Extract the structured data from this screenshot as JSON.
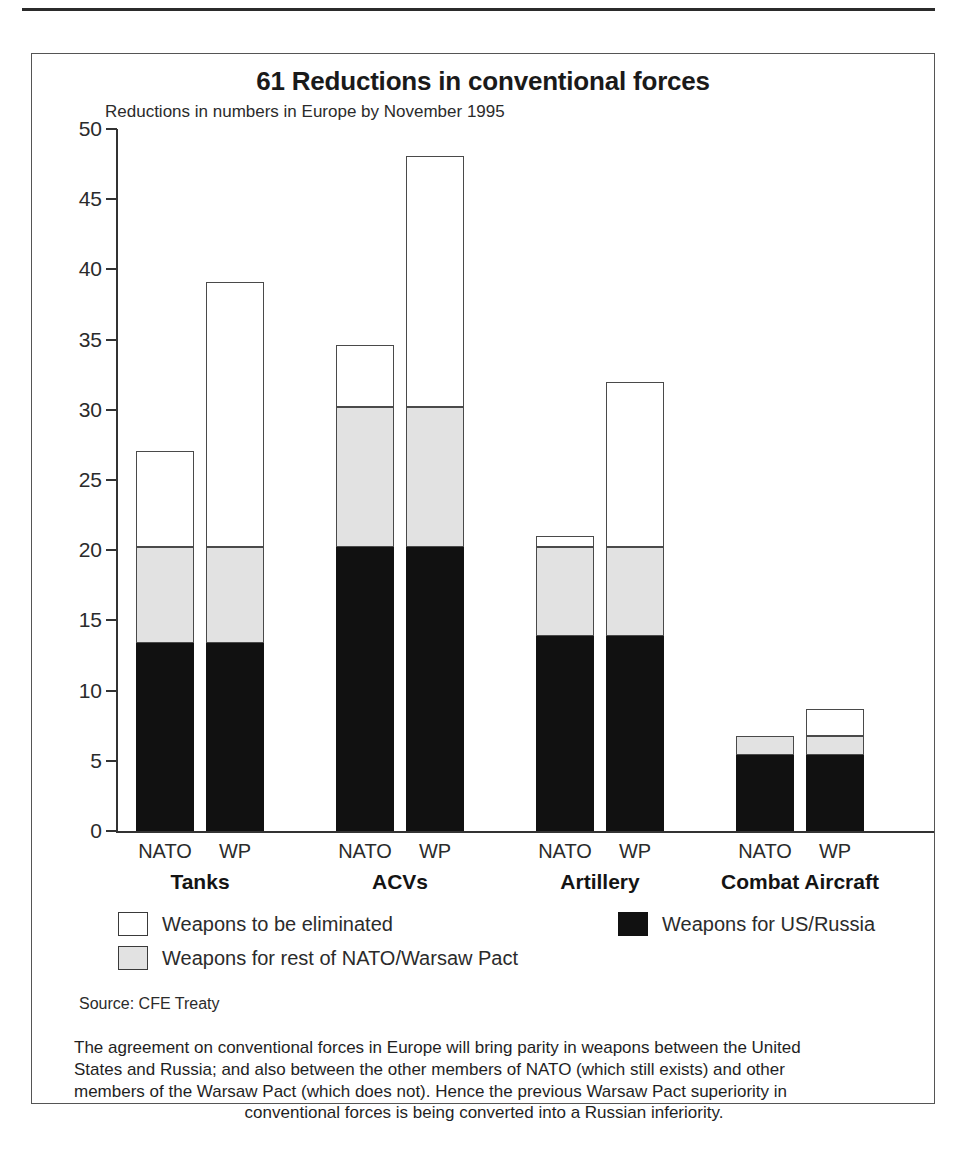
{
  "chart_data": {
    "type": "bar",
    "subtype": "stacked",
    "title": "61 Reductions in conventional forces",
    "subtitle": "Reductions in numbers in Europe by November 1995",
    "xlabel": "",
    "ylabel": "",
    "ylim": [
      0,
      50
    ],
    "ytick_labels": [
      "0",
      "5",
      "10",
      "15",
      "20",
      "25",
      "30",
      "35",
      "40",
      "45",
      "50"
    ],
    "ytick_values": [
      0,
      5,
      10,
      15,
      20,
      25,
      30,
      35,
      40,
      45,
      50
    ],
    "grid": false,
    "legend_position": "below-axes",
    "groups": [
      "Tanks",
      "ACVs",
      "Artillery",
      "Combat Aircraft"
    ],
    "categories": [
      "Tanks NATO",
      "Tanks WP",
      "ACVs NATO",
      "ACVs WP",
      "Artillery NATO",
      "Artillery WP",
      "Combat Aircraft NATO",
      "Combat Aircraft WP"
    ],
    "bar_labels": [
      "NATO",
      "WP",
      "NATO",
      "WP",
      "NATO",
      "WP",
      "NATO",
      "WP"
    ],
    "series": [
      {
        "name": "Weapons for US/Russia",
        "color": "#111111",
        "values": [
          13.4,
          13.4,
          20.2,
          20.2,
          13.9,
          13.9,
          5.4,
          5.4
        ]
      },
      {
        "name": "Weapons for rest of NATO/Warsaw Pact",
        "color": "#e2e2e2",
        "values": [
          6.8,
          6.8,
          10.0,
          10.0,
          6.3,
          6.3,
          1.4,
          1.4
        ]
      },
      {
        "name": "Weapons to be eliminated",
        "color": "#ffffff",
        "values": [
          6.9,
          18.9,
          4.4,
          17.9,
          0.8,
          11.8,
          0.0,
          1.9
        ]
      }
    ],
    "totals": [
      27.1,
      39.1,
      34.6,
      48.1,
      21.0,
      32.0,
      6.8,
      8.7
    ],
    "cumulative_tops": {
      "black": [
        13.4,
        13.4,
        20.2,
        20.2,
        13.9,
        13.9,
        5.4,
        5.4
      ],
      "grey": [
        20.2,
        20.2,
        30.2,
        30.2,
        20.2,
        20.2,
        6.8,
        6.8
      ],
      "white": [
        27.1,
        39.1,
        34.6,
        48.1,
        21.0,
        32.0,
        6.8,
        8.7
      ]
    }
  },
  "legend": {
    "items": [
      {
        "label": "Weapons to be eliminated",
        "swatch": "white"
      },
      {
        "label": "Weapons for US/Russia",
        "swatch": "black"
      },
      {
        "label": "Weapons for rest of NATO/Warsaw Pact",
        "swatch": "grey"
      }
    ]
  },
  "source": "Source: CFE Treaty",
  "caption": {
    "line1": "The agreement on conventional forces in Europe will bring parity in weapons between the United",
    "line2": "States and Russia; and also between the other members of NATO (which still exists) and other",
    "line3": "members of the Warsaw Pact (which does not). Hence the previous Warsaw Pact superiority in",
    "line4": "conventional forces is being converted into a Russian inferiority."
  },
  "colors": {
    "us_russia": "#111111",
    "rest": "#e2e2e2",
    "eliminated": "#ffffff",
    "frame": "#555555",
    "axis": "#333333"
  }
}
